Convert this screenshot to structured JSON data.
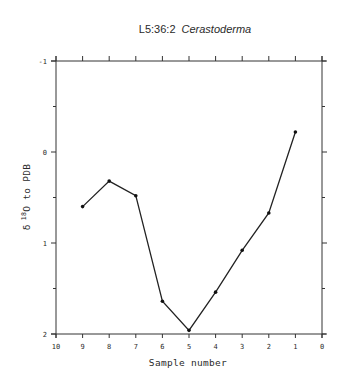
{
  "chart_data": {
    "type": "line",
    "title": "L5:36:2",
    "title_italic": "Cerastoderma",
    "xlabel": "Sample number",
    "ylabel": "δ ¹⁸O to PDB",
    "ylabel_parts": {
      "delta": "δ",
      "sup": "18",
      "rest": "O to PDB"
    },
    "x_reversed": true,
    "y_inverted": true,
    "xlim": [
      10,
      0
    ],
    "ylim": [
      -1,
      2
    ],
    "x_ticks": [
      "10",
      "9",
      "8",
      "7",
      "6",
      "5",
      "4",
      "3",
      "2",
      "1",
      "0"
    ],
    "y_ticks": [
      "-1",
      "0",
      "1",
      "2"
    ],
    "grid": false,
    "legend": null,
    "series": [
      {
        "name": "Cerastoderma",
        "x": [
          9,
          8,
          7,
          6,
          5,
          4,
          3,
          2,
          1
        ],
        "y": [
          0.6,
          0.32,
          0.48,
          1.64,
          1.96,
          1.54,
          1.08,
          0.67,
          -0.22
        ]
      }
    ]
  },
  "colors": {
    "line": "#222222",
    "axis": "#333333",
    "background": "#ffffff"
  }
}
